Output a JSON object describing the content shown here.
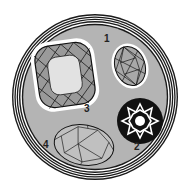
{
  "illustration": {
    "subject": "gemstone cut diagrams in a circular medallion",
    "colors": {
      "background": "#ffffff",
      "disc": "#b4b4b4",
      "ring": "#1a1a1a",
      "halo": "#ffffff",
      "gem_fill": "#c8c8c8",
      "gem_center": "#e6e6e6",
      "medallion_black": "#111111"
    },
    "labels": {
      "gem1": "1",
      "gem2": "2",
      "gem3": "3",
      "gem4": "4"
    }
  }
}
